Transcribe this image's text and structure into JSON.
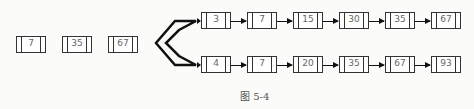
{
  "left_nodes": [
    "7",
    "35",
    "67"
  ],
  "top_list": [
    "3",
    "7",
    "15",
    "30",
    "35",
    "67"
  ],
  "bottom_list": [
    "4",
    "7",
    "20",
    "35",
    "67",
    "93"
  ],
  "caption": "图 5-4"
}
